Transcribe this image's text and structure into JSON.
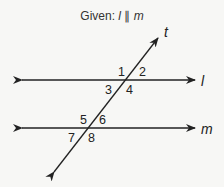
{
  "title": {
    "prefix": "Given: ",
    "line_a": "l",
    "symbol": " ∥ ",
    "line_b": "m"
  },
  "lines": {
    "transversal": {
      "name": "t"
    },
    "upper": {
      "name": "l"
    },
    "lower": {
      "name": "m"
    }
  },
  "angles": [
    "1",
    "2",
    "3",
    "4",
    "5",
    "6",
    "7",
    "8"
  ],
  "colors": {
    "stroke": "#222222",
    "background": "#f7f7f5"
  }
}
